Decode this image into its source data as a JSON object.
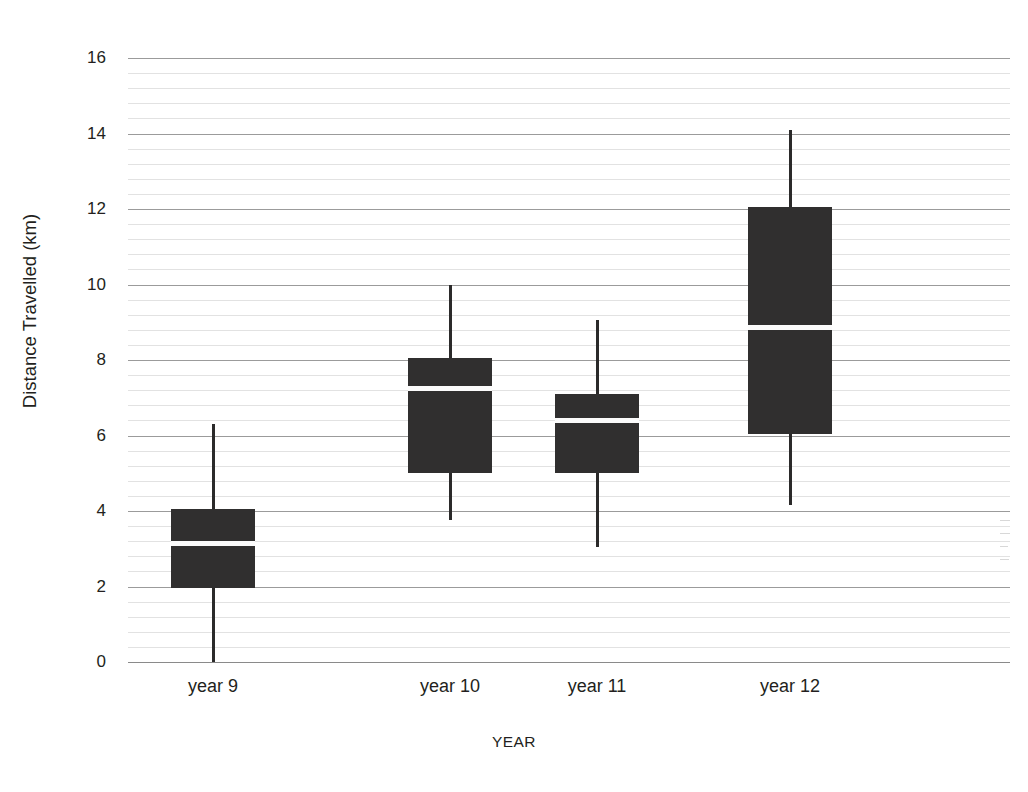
{
  "caption": {
    "text": "shown on the vertical axis."
  },
  "chart_data": {
    "type": "box",
    "title": "",
    "xlabel": "YEAR",
    "ylabel": "Distance Travelled (km)",
    "categories": [
      "year 9",
      "year 10",
      "year 11",
      "year 12"
    ],
    "ylim": [
      0,
      16
    ],
    "ytick_labels": [
      "0",
      "2",
      "4",
      "6",
      "8",
      "10",
      "12",
      "14",
      "16"
    ],
    "ytick_values": [
      0,
      2,
      4,
      6,
      8,
      10,
      12,
      14,
      16
    ],
    "grid": {
      "major_step": 2,
      "minor_step": 0.4,
      "visible": true
    },
    "legend": {
      "visible": false,
      "position": "none"
    },
    "series": [
      {
        "name": "year 9",
        "min": 0.0,
        "q1": 1.95,
        "median": 3.15,
        "q3": 4.05,
        "max": 6.3
      },
      {
        "name": "year 10",
        "min": 3.75,
        "q1": 5.0,
        "median": 7.25,
        "q3": 8.05,
        "max": 10.0
      },
      {
        "name": "year 11",
        "min": 3.05,
        "q1": 5.0,
        "median": 6.4,
        "q3": 7.1,
        "max": 9.05
      },
      {
        "name": "year 12",
        "min": 4.15,
        "q1": 6.05,
        "median": 8.85,
        "q3": 12.05,
        "max": 14.1
      }
    ],
    "colors": {
      "box_fill": "#302f2f",
      "median_line": "#fbfbfb",
      "whisker": "#2b2a2a",
      "major_grid": "#9b9b9b",
      "minor_grid": "#e2e2e2",
      "text": "#231f20",
      "background": "#ffffff"
    }
  }
}
